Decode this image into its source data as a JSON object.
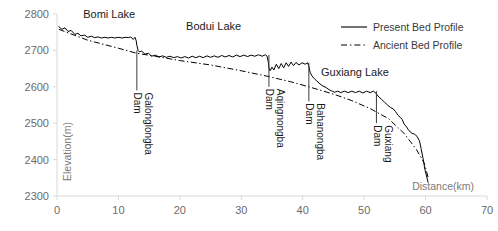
{
  "chart_data": {
    "type": "line",
    "title": "",
    "xlabel": "Distance(km)",
    "ylabel": "Elevation(m)",
    "xlim": [
      0,
      70
    ],
    "ylim": [
      2300,
      2800
    ],
    "xticks": [
      0,
      10,
      20,
      30,
      40,
      50,
      60,
      70
    ],
    "yticks": [
      2300,
      2400,
      2500,
      2600,
      2700,
      2800
    ],
    "grid": false,
    "legend_position": "top-right",
    "series": [
      {
        "name": "Present Bed Profile",
        "style": "solid",
        "color": "#000000",
        "points": [
          [
            0.3,
            2765
          ],
          [
            0.8,
            2758
          ],
          [
            1.3,
            2762
          ],
          [
            1.8,
            2752
          ],
          [
            2.3,
            2755
          ],
          [
            2.9,
            2744
          ],
          [
            3.4,
            2747
          ],
          [
            3.9,
            2740
          ],
          [
            4.5,
            2742
          ],
          [
            5.0,
            2736
          ],
          [
            5.6,
            2739
          ],
          [
            6.1,
            2735
          ],
          [
            6.7,
            2737
          ],
          [
            7.2,
            2734
          ],
          [
            7.8,
            2736
          ],
          [
            8.3,
            2734
          ],
          [
            8.9,
            2736
          ],
          [
            9.4,
            2734
          ],
          [
            10.0,
            2736
          ],
          [
            10.6,
            2734
          ],
          [
            11.1,
            2736
          ],
          [
            11.6,
            2735
          ],
          [
            12.0,
            2737
          ],
          [
            12.4,
            2730
          ],
          [
            12.7,
            2736
          ],
          [
            12.9,
            2726
          ],
          [
            13.0,
            2714
          ],
          [
            13.2,
            2700
          ],
          [
            13.4,
            2696
          ],
          [
            13.8,
            2698
          ],
          [
            14.3,
            2690
          ],
          [
            14.9,
            2692
          ],
          [
            15.4,
            2684
          ],
          [
            16.0,
            2687
          ],
          [
            16.6,
            2682
          ],
          [
            17.2,
            2685
          ],
          [
            17.8,
            2681
          ],
          [
            18.4,
            2684
          ],
          [
            19.0,
            2680
          ],
          [
            19.6,
            2683
          ],
          [
            20.2,
            2679
          ],
          [
            20.8,
            2683
          ],
          [
            21.4,
            2679
          ],
          [
            22.0,
            2684
          ],
          [
            22.6,
            2680
          ],
          [
            23.2,
            2684
          ],
          [
            23.8,
            2680
          ],
          [
            24.4,
            2685
          ],
          [
            25.0,
            2681
          ],
          [
            25.6,
            2685
          ],
          [
            26.2,
            2681
          ],
          [
            26.8,
            2686
          ],
          [
            27.4,
            2682
          ],
          [
            28.0,
            2686
          ],
          [
            28.6,
            2682
          ],
          [
            29.2,
            2687
          ],
          [
            29.8,
            2683
          ],
          [
            30.4,
            2687
          ],
          [
            31.0,
            2683
          ],
          [
            31.6,
            2687
          ],
          [
            32.2,
            2684
          ],
          [
            32.8,
            2688
          ],
          [
            33.4,
            2684
          ],
          [
            33.9,
            2688
          ],
          [
            34.2,
            2684
          ],
          [
            34.4,
            2668
          ],
          [
            34.5,
            2652
          ],
          [
            34.7,
            2644
          ],
          [
            35.0,
            2654
          ],
          [
            35.3,
            2646
          ],
          [
            35.7,
            2662
          ],
          [
            36.1,
            2650
          ],
          [
            36.5,
            2664
          ],
          [
            36.9,
            2652
          ],
          [
            37.3,
            2666
          ],
          [
            37.7,
            2656
          ],
          [
            38.1,
            2668
          ],
          [
            38.5,
            2658
          ],
          [
            38.9,
            2667
          ],
          [
            39.4,
            2660
          ],
          [
            39.9,
            2666
          ],
          [
            40.4,
            2662
          ],
          [
            40.8,
            2666
          ],
          [
            41.0,
            2656
          ],
          [
            41.2,
            2640
          ],
          [
            41.5,
            2630
          ],
          [
            41.9,
            2622
          ],
          [
            42.3,
            2616
          ],
          [
            42.8,
            2608
          ],
          [
            43.3,
            2602
          ],
          [
            43.8,
            2598
          ],
          [
            44.3,
            2592
          ],
          [
            44.8,
            2588
          ],
          [
            45.2,
            2585
          ],
          [
            45.7,
            2588
          ],
          [
            46.2,
            2584
          ],
          [
            46.8,
            2588
          ],
          [
            47.4,
            2584
          ],
          [
            48.0,
            2588
          ],
          [
            48.6,
            2584
          ],
          [
            49.2,
            2588
          ],
          [
            49.8,
            2583
          ],
          [
            50.4,
            2588
          ],
          [
            51.0,
            2584
          ],
          [
            51.5,
            2588
          ],
          [
            51.9,
            2583
          ],
          [
            52.1,
            2578
          ],
          [
            52.4,
            2572
          ],
          [
            52.8,
            2566
          ],
          [
            53.3,
            2558
          ],
          [
            53.8,
            2550
          ],
          [
            54.3,
            2543
          ],
          [
            54.7,
            2540
          ],
          [
            55.1,
            2532
          ],
          [
            55.5,
            2522
          ],
          [
            55.9,
            2516
          ],
          [
            56.2,
            2510
          ],
          [
            56.5,
            2498
          ],
          [
            56.9,
            2490
          ],
          [
            57.2,
            2482
          ],
          [
            57.5,
            2476
          ],
          [
            57.8,
            2472
          ],
          [
            58.2,
            2470
          ],
          [
            58.6,
            2464
          ],
          [
            59.0,
            2452
          ],
          [
            59.3,
            2428
          ],
          [
            59.6,
            2402
          ],
          [
            59.9,
            2372
          ],
          [
            60.2,
            2352
          ],
          [
            60.4,
            2338
          ]
        ]
      },
      {
        "name": "Ancient Bed Profile",
        "style": "dash-dot",
        "color": "#000000",
        "points": [
          [
            0.3,
            2758
          ],
          [
            5.0,
            2728
          ],
          [
            10.0,
            2706
          ],
          [
            13.0,
            2692
          ],
          [
            16.0,
            2684
          ],
          [
            20.0,
            2672
          ],
          [
            25.0,
            2660
          ],
          [
            30.0,
            2644
          ],
          [
            34.5,
            2628
          ],
          [
            38.0,
            2614
          ],
          [
            41.0,
            2600
          ],
          [
            45.0,
            2580
          ],
          [
            48.0,
            2562
          ],
          [
            51.0,
            2540
          ],
          [
            54.0,
            2512
          ],
          [
            56.5,
            2472
          ],
          [
            58.5,
            2428
          ],
          [
            59.8,
            2390
          ],
          [
            60.4,
            2352
          ]
        ]
      }
    ],
    "lake_annotations": [
      {
        "label": "Bomi Lake",
        "x": 8.5,
        "y": 2790
      },
      {
        "label": "Bodui Lake",
        "x": 25.5,
        "y": 2755
      },
      {
        "label": "Guxiang Lake",
        "x": 48.5,
        "y": 2630
      }
    ],
    "dam_annotations": [
      {
        "name": "Galonglongba",
        "suffix": "Dam",
        "x": 13.0,
        "line_top": 2700,
        "line_bottom": 2590
      },
      {
        "name": "Aqingnongba",
        "suffix": "Dam",
        "x": 34.5,
        "line_top": 2688,
        "line_bottom": 2600
      },
      {
        "name": "Bahanongba",
        "suffix": "Dam",
        "x": 41.0,
        "line_top": 2666,
        "line_bottom": 2560
      },
      {
        "name": "Guxiang",
        "suffix": "Dam",
        "x": 52.0,
        "line_top": 2588,
        "line_bottom": 2500
      }
    ]
  },
  "legend": {
    "items": [
      {
        "label": "Present Bed Profile",
        "style": "solid"
      },
      {
        "label": "Ancient Bed Profile",
        "style": "dash-dot"
      }
    ]
  },
  "axis": {
    "x_title": "Distance(km)",
    "y_title": "Elevation(m)",
    "x_tick_labels": [
      "0",
      "10",
      "20",
      "30",
      "40",
      "50",
      "60",
      "70"
    ],
    "y_tick_labels": [
      "2300",
      "2400",
      "2500",
      "2600",
      "2700",
      "2800"
    ]
  },
  "colors": {
    "line": "#000000",
    "frame": "#d9d9d9",
    "tick_text": "#6b6b6b",
    "annotation_text": "#1a1a1a"
  }
}
